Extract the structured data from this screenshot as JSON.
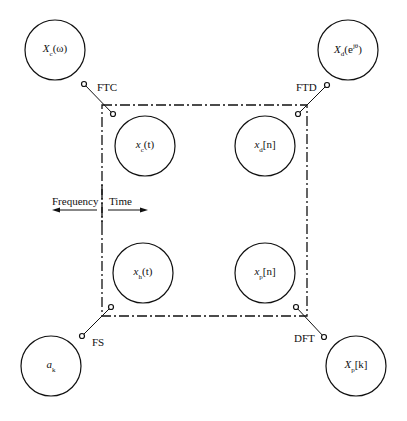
{
  "nodes": [
    {
      "id": "Xc",
      "base": "X",
      "sub": "c",
      "arg": "(ω)",
      "cx": 55,
      "cy": 50
    },
    {
      "id": "Xd",
      "base": "X",
      "sub": "d",
      "arg": "(e",
      "sup": "jθ",
      "close": ")",
      "cx": 348,
      "cy": 50
    },
    {
      "id": "xc",
      "base": "x",
      "sub": "c",
      "arg": "(t)",
      "cx": 145,
      "cy": 146
    },
    {
      "id": "xd",
      "base": "x",
      "sub": "d",
      "arg": "[n]",
      "cx": 265,
      "cy": 146
    },
    {
      "id": "xh",
      "base": "x",
      "sub": "h",
      "arg": "(t)",
      "cx": 143,
      "cy": 273
    },
    {
      "id": "xp",
      "base": "x",
      "sub": "p",
      "arg": "[n]",
      "cx": 265,
      "cy": 273
    },
    {
      "id": "ak",
      "base": "a",
      "sub": "k",
      "arg": "",
      "cx": 51,
      "cy": 366
    },
    {
      "id": "Xp",
      "base": "X",
      "sub": "p",
      "arg": "[k]",
      "cx": 356,
      "cy": 366
    }
  ],
  "transforms": [
    {
      "label": "FTC",
      "x1": 84,
      "y1": 84,
      "x2": 113,
      "y2": 114,
      "lx": 97,
      "ly": 81
    },
    {
      "label": "FTD",
      "x1": 327,
      "y1": 85,
      "x2": 298,
      "y2": 114,
      "lx": 296,
      "ly": 81
    },
    {
      "label": "FS",
      "x1": 111,
      "y1": 307,
      "x2": 82,
      "y2": 336,
      "lx": 92,
      "ly": 336
    },
    {
      "label": "DFT",
      "x1": 296,
      "y1": 307,
      "x2": 324,
      "y2": 337,
      "lx": 294,
      "ly": 332
    }
  ],
  "domain_labels": {
    "frequency": "Frequency",
    "time": "Time"
  },
  "box": {
    "x": 102,
    "y": 105,
    "w": 205,
    "h": 211
  }
}
